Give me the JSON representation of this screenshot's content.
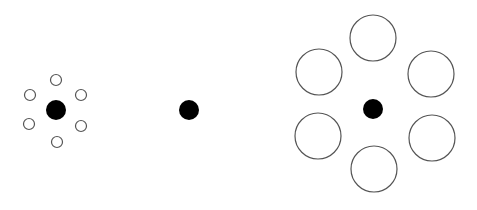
{
  "diagram": {
    "type": "ebbinghaus-illusion",
    "background": "#ffffff",
    "fill_color": "#000000",
    "stroke_color": "#555555",
    "groups": [
      {
        "name": "small-surround-group",
        "center": {
          "cx": 56,
          "cy": 110,
          "r": 10
        },
        "surround": [
          {
            "cx": 56,
            "cy": 80,
            "r": 5.5
          },
          {
            "cx": 30,
            "cy": 95,
            "r": 5.5
          },
          {
            "cx": 81,
            "cy": 95,
            "r": 5.5
          },
          {
            "cx": 29,
            "cy": 124,
            "r": 5.5
          },
          {
            "cx": 81,
            "cy": 126,
            "r": 5.5
          },
          {
            "cx": 57,
            "cy": 142,
            "r": 5.5
          }
        ]
      },
      {
        "name": "isolated-group",
        "center": {
          "cx": 189,
          "cy": 110,
          "r": 10
        },
        "surround": []
      },
      {
        "name": "large-surround-group",
        "center": {
          "cx": 373,
          "cy": 109,
          "r": 10
        },
        "surround": [
          {
            "cx": 373,
            "cy": 38,
            "r": 23
          },
          {
            "cx": 319,
            "cy": 72,
            "r": 23
          },
          {
            "cx": 431,
            "cy": 74,
            "r": 23
          },
          {
            "cx": 318,
            "cy": 136,
            "r": 23
          },
          {
            "cx": 432,
            "cy": 138,
            "r": 23
          },
          {
            "cx": 374,
            "cy": 169,
            "r": 23
          }
        ]
      }
    ]
  }
}
